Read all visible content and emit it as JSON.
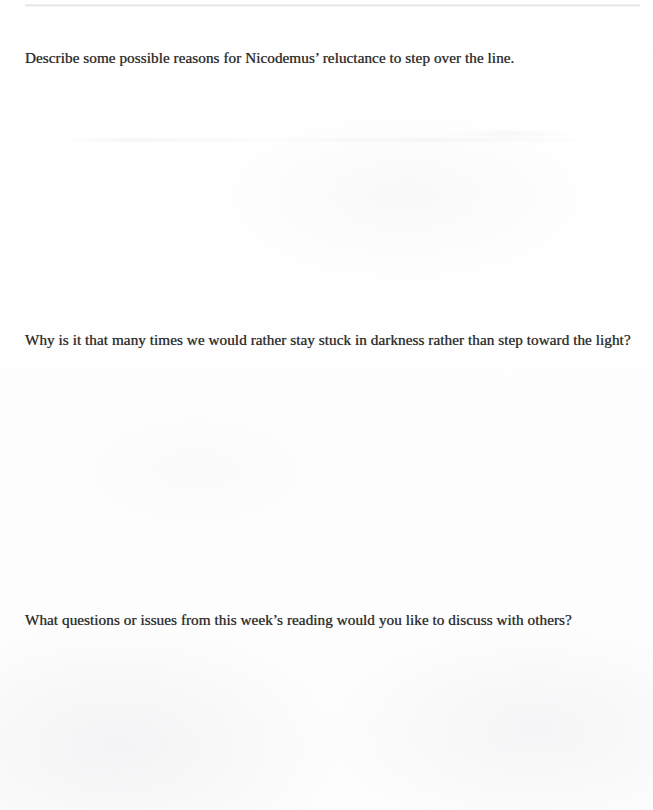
{
  "document": {
    "type": "scanned-worksheet",
    "page_background": "#fefefe",
    "text_color": "#2e2e2e",
    "questions": [
      {
        "number": 1,
        "text": "Describe some possible reasons for Nicodemus’ reluctance to step over the line."
      },
      {
        "number": 2,
        "text": "Why is it that many times we would rather stay stuck in darkness rather than step toward the light?"
      },
      {
        "number": 3,
        "text": "What questions or issues from this week’s reading would you like to discuss with others?"
      }
    ],
    "answer_spaces": [
      {
        "for_question": 1,
        "content": ""
      },
      {
        "for_question": 2,
        "content": ""
      },
      {
        "for_question": 3,
        "content": ""
      }
    ],
    "artifacts": {
      "scan_edge_line_color": "#dddde1",
      "bleed_through_color": "#f6f6f8"
    }
  }
}
